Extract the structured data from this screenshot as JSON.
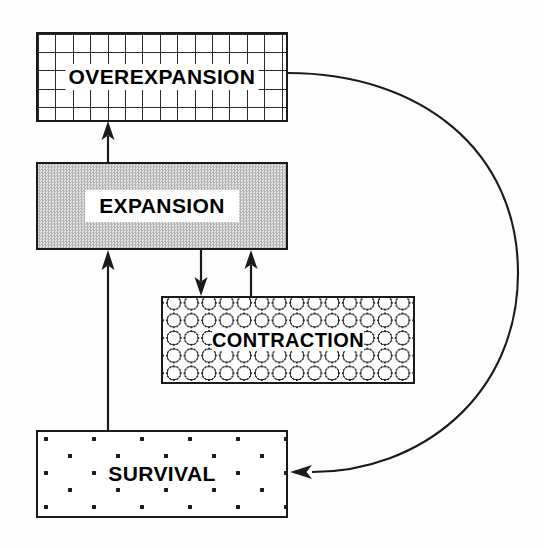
{
  "diagram": {
    "background_color": "#ffffff",
    "line_color": "#1a1a1a",
    "nodes": [
      {
        "id": "overexpansion",
        "label": "OVEREXPANSION",
        "fill_pattern": "grid",
        "fill_color": "#ffffff",
        "x": 36,
        "y": 32,
        "width": 252,
        "height": 90
      },
      {
        "id": "expansion",
        "label": "EXPANSION",
        "fill_pattern": "gray-stipple",
        "fill_color": "#c9c9c9",
        "x": 36,
        "y": 162,
        "width": 252,
        "height": 88
      },
      {
        "id": "contraction",
        "label": "CONTRACTION",
        "fill_pattern": "circles",
        "fill_color": "#ffffff",
        "x": 161,
        "y": 296,
        "width": 254,
        "height": 88
      },
      {
        "id": "survival",
        "label": "SURVIVAL",
        "fill_pattern": "dots",
        "fill_color": "#ffffff",
        "x": 36,
        "y": 430,
        "width": 252,
        "height": 88
      }
    ],
    "edges": [
      {
        "id": "expansion-to-overexpansion",
        "from": "expansion",
        "to": "overexpansion",
        "shape": "straight",
        "direction": "up"
      },
      {
        "id": "expansion-to-contraction",
        "from": "expansion",
        "to": "contraction",
        "shape": "straight",
        "direction": "down"
      },
      {
        "id": "contraction-to-expansion",
        "from": "contraction",
        "to": "expansion",
        "shape": "straight",
        "direction": "up"
      },
      {
        "id": "survival-to-expansion",
        "from": "survival",
        "to": "expansion",
        "shape": "straight",
        "direction": "up"
      },
      {
        "id": "overexpansion-to-survival",
        "from": "overexpansion",
        "to": "survival",
        "shape": "curved",
        "direction": "left"
      }
    ]
  }
}
